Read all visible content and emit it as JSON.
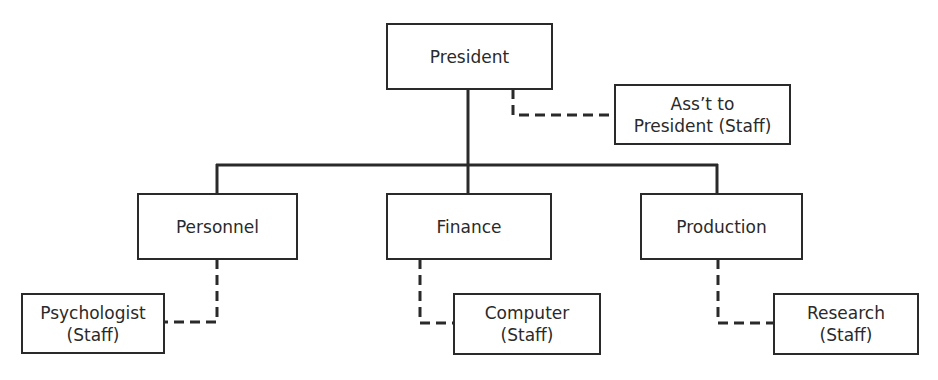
{
  "diagram": {
    "type": "organization-chart",
    "nodes": {
      "president": {
        "label": "President"
      },
      "assistant": {
        "line1": "Ass’t to",
        "line2": "President (Staff)"
      },
      "personnel": {
        "label": "Personnel"
      },
      "finance": {
        "label": "Finance"
      },
      "production": {
        "label": "Production"
      },
      "psychologist": {
        "line1": "Psychologist",
        "line2": "(Staff)"
      },
      "computer": {
        "line1": "Computer",
        "line2": "(Staff)"
      },
      "research": {
        "line1": "Research",
        "line2": "(Staff)"
      }
    },
    "edges": [
      {
        "from": "President",
        "to": "Personnel",
        "style": "solid"
      },
      {
        "from": "President",
        "to": "Finance",
        "style": "solid"
      },
      {
        "from": "President",
        "to": "Production",
        "style": "solid"
      },
      {
        "from": "President",
        "to": "Ass't to President (Staff)",
        "style": "dashed"
      },
      {
        "from": "Personnel",
        "to": "Psychologist (Staff)",
        "style": "dashed"
      },
      {
        "from": "Finance",
        "to": "Computer (Staff)",
        "style": "dashed"
      },
      {
        "from": "Production",
        "to": "Research (Staff)",
        "style": "dashed"
      }
    ],
    "line_color": "#2a2a2a"
  }
}
